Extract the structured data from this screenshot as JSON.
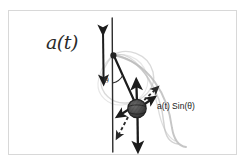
{
  "figure": {
    "kind": "hand-drawn-physics-diagram",
    "background_color": "#ffffff",
    "frame_border_color": "#d8d8d8",
    "ink_color": "#1c1c1c",
    "trace_color": "#b9b9b9",
    "bob_fill_color": "#4a4a4a"
  },
  "labels": {
    "drive_acceleration": "a(t)",
    "tangential_component": "a(t) Sin(θ)",
    "angle": "θ"
  },
  "icons": {
    "vertical_double_arrow": "double-headed-vertical-arrow",
    "pivot": "pivot-point-dot",
    "bob": "pendulum-bob-circle",
    "swing_arc": "swing-trajectory-arc",
    "dashed_projection": "dashed-projection-line"
  },
  "elements": [
    {
      "name": "support-rod",
      "description": "vertical line through pivot"
    },
    {
      "name": "drive-arrow",
      "description": "double headed vertical arrow left of rod"
    },
    {
      "name": "pendulum-rod",
      "description": "straight rod from pivot down-right to bob"
    },
    {
      "name": "angle-arc",
      "description": "small arc between vertical rod and pendulum rod"
    },
    {
      "name": "bob",
      "description": "shaded circular mass"
    },
    {
      "name": "arrow-up",
      "description": "arrow from bob pointing up along rod direction"
    },
    {
      "name": "arrow-down",
      "description": "long arrow from bob pointing down"
    },
    {
      "name": "arrow-component",
      "description": "short diagonal arrow up-right for a(t)Sin(theta)"
    },
    {
      "name": "arrow-tangential-left",
      "description": "short arrow down-left from bob"
    },
    {
      "name": "dashed-up-right",
      "description": "dashed line up-right from bob"
    },
    {
      "name": "dashed-down-left",
      "description": "dashed line down-left from bob"
    },
    {
      "name": "swing-arcs",
      "description": "three faint grey arcs showing swing envelope"
    }
  ]
}
